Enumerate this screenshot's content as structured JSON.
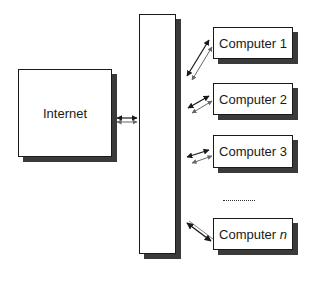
{
  "diagram": {
    "internet": {
      "label": "Internet"
    },
    "hub": {
      "label": ""
    },
    "computers": [
      {
        "label": "Computer 1"
      },
      {
        "label": "Computer 2"
      },
      {
        "label": "Computer 3"
      },
      {
        "label_prefix": "Computer ",
        "label_var": "n"
      }
    ],
    "ellipsis": "........."
  }
}
